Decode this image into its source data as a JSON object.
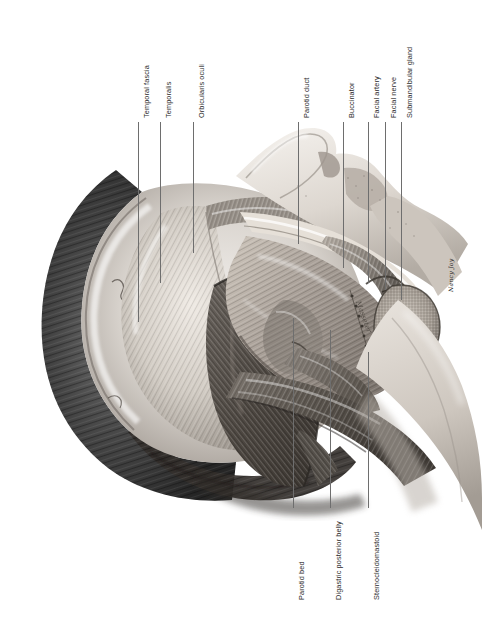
{
  "figure": {
    "orientation": "rotated 90 degrees; head faces upper-right",
    "signature": "Nancy Joy",
    "background_color": "#ffffff",
    "line_color": "#6e6e6e",
    "text_color": "#2a2a2a"
  },
  "labels_top": [
    {
      "text": "Temporal fascia",
      "x": 138,
      "label_bottom": 118,
      "line_top": 122,
      "line_bottom": 322
    },
    {
      "text": "Temporalis",
      "x": 160,
      "label_bottom": 118,
      "line_top": 122,
      "line_bottom": 283
    },
    {
      "text": "Orbicularis oculi",
      "x": 193,
      "label_bottom": 118,
      "line_top": 122,
      "line_bottom": 253
    },
    {
      "text": "Parotid duct",
      "x": 298,
      "label_bottom": 118,
      "line_top": 122,
      "line_bottom": 244
    },
    {
      "text": "Buccinator",
      "x": 343,
      "label_bottom": 118,
      "line_top": 122,
      "line_bottom": 268
    },
    {
      "text": "Facial artery",
      "x": 368,
      "label_bottom": 118,
      "line_top": 122,
      "line_bottom": 283
    },
    {
      "text": "Facial nerve",
      "x": 385,
      "label_bottom": 118,
      "line_top": 122,
      "line_bottom": 290
    },
    {
      "text": "Submandibular gland",
      "x": 401,
      "label_bottom": 118,
      "line_top": 122,
      "line_bottom": 300
    }
  ],
  "labels_bottom": [
    {
      "text": "Parotid bed",
      "x": 293,
      "label_top": 512,
      "line_top": 318,
      "line_bottom": 508
    },
    {
      "text": "Digastric posterior belly",
      "x": 330,
      "label_top": 512,
      "line_top": 330,
      "line_bottom": 508
    },
    {
      "text": "Sternocleidomastoid",
      "x": 368,
      "label_top": 512,
      "line_top": 352,
      "line_bottom": 508
    }
  ]
}
